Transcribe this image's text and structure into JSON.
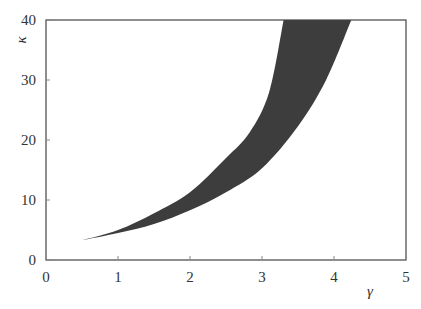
{
  "chart_data": {
    "type": "area",
    "title": "",
    "xlabel": "γ",
    "ylabel": "κ",
    "xlim": [
      0,
      5
    ],
    "ylim": [
      0,
      40
    ],
    "xticks": [
      0,
      1,
      2,
      3,
      4,
      5
    ],
    "yticks": [
      0,
      10,
      20,
      30,
      40
    ],
    "grid": false,
    "legend": null,
    "fill_color": "#3d3d3d",
    "series": [
      {
        "name": "upper boundary",
        "x": [
          0.5,
          1.0,
          1.5,
          2.0,
          2.5,
          2.83,
          3.1,
          3.3
        ],
        "y": [
          3.3,
          5.0,
          7.8,
          11.3,
          17.0,
          21.3,
          28.0,
          40.0
        ]
      },
      {
        "name": "lower boundary",
        "x": [
          0.5,
          1.0,
          1.5,
          2.0,
          2.5,
          3.0,
          3.5,
          3.89,
          4.24
        ],
        "y": [
          3.3,
          4.5,
          6.0,
          8.3,
          11.3,
          15.3,
          22.3,
          30.0,
          40.0
        ]
      }
    ]
  }
}
